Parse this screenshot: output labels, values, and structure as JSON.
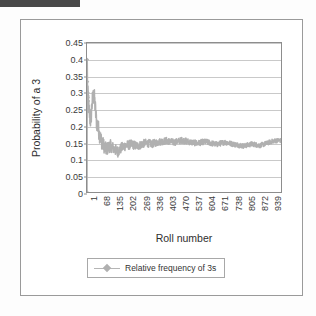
{
  "page": {
    "background_color": "#fdfdfd",
    "top_bar_color": "#484848"
  },
  "chart": {
    "frame_border_color": "#9a9a9a",
    "plot_border_color": "#8d8d8d",
    "gridline_color": "#c9c9c9",
    "series_color": "#b0b0b0",
    "y_title": "Probability of a 3",
    "x_title": "Roll number",
    "legend_label": "Relative frequency of 3s"
  },
  "chart_data": {
    "type": "line",
    "title": "",
    "xlabel": "Roll number",
    "ylabel": "Probability of a 3",
    "ylim": [
      0,
      0.45
    ],
    "xlim": [
      1,
      1000
    ],
    "grid": true,
    "legend_position": "bottom",
    "yticks": [
      0,
      0.05,
      0.1,
      0.15,
      0.2,
      0.25,
      0.3,
      0.35,
      0.4,
      0.45
    ],
    "ytick_labels": [
      "0",
      "0.05",
      "0.1",
      "0.15",
      "0.2",
      "0.25",
      "0.3",
      "0.35",
      "0.4",
      "0.45"
    ],
    "xticks": [
      1,
      68,
      135,
      202,
      269,
      336,
      403,
      470,
      537,
      604,
      671,
      738,
      805,
      872,
      939
    ],
    "xtick_labels": [
      "1",
      "68",
      "135",
      "202",
      "269",
      "336",
      "403",
      "470",
      "537",
      "604",
      "671",
      "738",
      "805",
      "872",
      "939"
    ],
    "series": [
      {
        "name": "Relative frequency of 3s",
        "marker": "diamond",
        "color": "#b0b0b0",
        "x": [
          1,
          2,
          3,
          4,
          5,
          6,
          7,
          8,
          9,
          10,
          12,
          14,
          16,
          18,
          20,
          23,
          26,
          29,
          32,
          35,
          38,
          41,
          44,
          47,
          50,
          55,
          60,
          65,
          70,
          75,
          80,
          85,
          90,
          95,
          100,
          110,
          120,
          130,
          140,
          150,
          160,
          170,
          180,
          190,
          200,
          215,
          230,
          245,
          260,
          275,
          290,
          305,
          320,
          335,
          350,
          370,
          390,
          410,
          430,
          450,
          470,
          490,
          510,
          530,
          550,
          570,
          590,
          610,
          630,
          650,
          670,
          690,
          710,
          730,
          750,
          770,
          790,
          810,
          830,
          850,
          870,
          890,
          910,
          930,
          950,
          970,
          990,
          1000
        ],
        "y": [
          0.0,
          0.4,
          0.333,
          0.3,
          0.3,
          0.29,
          0.285,
          0.275,
          0.26,
          0.25,
          0.24,
          0.235,
          0.225,
          0.22,
          0.215,
          0.235,
          0.26,
          0.275,
          0.285,
          0.29,
          0.285,
          0.27,
          0.25,
          0.23,
          0.215,
          0.2,
          0.19,
          0.175,
          0.165,
          0.155,
          0.148,
          0.142,
          0.138,
          0.132,
          0.128,
          0.134,
          0.14,
          0.136,
          0.13,
          0.126,
          0.122,
          0.128,
          0.134,
          0.138,
          0.14,
          0.142,
          0.144,
          0.141,
          0.139,
          0.142,
          0.146,
          0.148,
          0.147,
          0.145,
          0.148,
          0.151,
          0.153,
          0.155,
          0.152,
          0.15,
          0.153,
          0.156,
          0.154,
          0.151,
          0.149,
          0.147,
          0.15,
          0.152,
          0.149,
          0.146,
          0.144,
          0.147,
          0.15,
          0.148,
          0.145,
          0.143,
          0.141,
          0.139,
          0.142,
          0.145,
          0.143,
          0.14,
          0.144,
          0.148,
          0.152,
          0.155,
          0.156,
          0.155
        ]
      }
    ]
  }
}
